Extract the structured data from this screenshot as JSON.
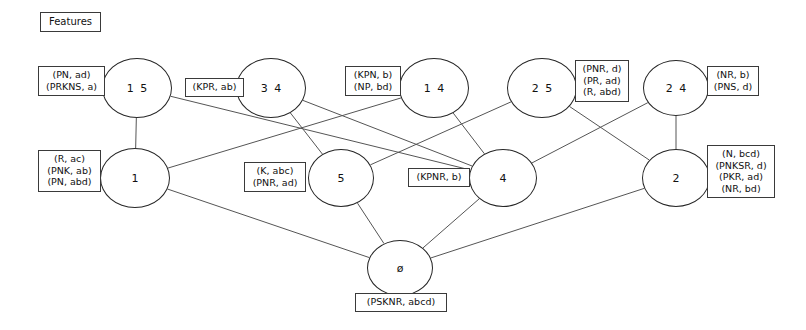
{
  "title_box": {
    "label": "Features"
  },
  "diagram": {
    "kind": "concept-lattice",
    "nodes": [
      {
        "id": "n15",
        "label": "1 5",
        "cx": 137,
        "cy": 88,
        "rx": 35,
        "ry": 30
      },
      {
        "id": "n34",
        "label": "3 4",
        "cx": 271,
        "cy": 88,
        "rx": 35,
        "ry": 30
      },
      {
        "id": "n14",
        "label": "1 4",
        "cx": 434,
        "cy": 88,
        "rx": 35,
        "ry": 30
      },
      {
        "id": "n25",
        "label": "2 5",
        "cx": 542,
        "cy": 88,
        "rx": 35,
        "ry": 30
      },
      {
        "id": "n24",
        "label": "2 4",
        "cx": 676,
        "cy": 88,
        "rx": 33,
        "ry": 28
      },
      {
        "id": "n1",
        "label": "1",
        "cx": 135,
        "cy": 178,
        "rx": 35,
        "ry": 30
      },
      {
        "id": "n5",
        "label": "5",
        "cx": 341,
        "cy": 178,
        "rx": 33,
        "ry": 29
      },
      {
        "id": "n4",
        "label": "4",
        "cx": 503,
        "cy": 178,
        "rx": 34,
        "ry": 29
      },
      {
        "id": "n2",
        "label": "2",
        "cx": 676,
        "cy": 178,
        "rx": 34,
        "ry": 29
      },
      {
        "id": "n0",
        "label": "ø",
        "cx": 400,
        "cy": 268,
        "rx": 33,
        "ry": 28
      }
    ],
    "edges": [
      {
        "from": "n15",
        "to": "n1"
      },
      {
        "from": "n15",
        "to": "n4"
      },
      {
        "from": "n34",
        "to": "n5"
      },
      {
        "from": "n34",
        "to": "n4"
      },
      {
        "from": "n14",
        "to": "n1"
      },
      {
        "from": "n14",
        "to": "n4"
      },
      {
        "from": "n25",
        "to": "n5"
      },
      {
        "from": "n25",
        "to": "n2"
      },
      {
        "from": "n24",
        "to": "n4"
      },
      {
        "from": "n24",
        "to": "n2"
      },
      {
        "from": "n1",
        "to": "n0"
      },
      {
        "from": "n5",
        "to": "n0"
      },
      {
        "from": "n4",
        "to": "n0"
      },
      {
        "from": "n2",
        "to": "n0"
      }
    ],
    "attribute_boxes": [
      {
        "id": "lbl-n15",
        "for": "n15",
        "lines": [
          "(PN, ad)",
          "(PRKNS, a)"
        ],
        "left": 38,
        "top": 66,
        "width": 67
      },
      {
        "id": "lbl-n34",
        "for": "n34",
        "lines": [
          "(KPR, ab)"
        ],
        "left": 185,
        "top": 78,
        "width": 59
      },
      {
        "id": "lbl-n14",
        "for": "n14",
        "lines": [
          "(KPN, b)",
          "(NP, bd)"
        ],
        "left": 345,
        "top": 66,
        "width": 56
      },
      {
        "id": "lbl-n25",
        "for": "n25",
        "lines": [
          "(PNR, d)",
          "(PR, ad)",
          "(R, abd)"
        ],
        "left": 575,
        "top": 60,
        "width": 54
      },
      {
        "id": "lbl-n24",
        "for": "n24",
        "lines": [
          "(NR, b)",
          "(PNS, d)"
        ],
        "left": 707,
        "top": 66,
        "width": 52
      },
      {
        "id": "lbl-n1",
        "for": "n1",
        "lines": [
          "(R, ac)",
          "(PNK, ab)",
          "(PN, abd)"
        ],
        "left": 38,
        "top": 150,
        "width": 63
      },
      {
        "id": "lbl-n5",
        "for": "n5",
        "lines": [
          "(K, abc)",
          "(PNR, ad)"
        ],
        "left": 244,
        "top": 162,
        "width": 62
      },
      {
        "id": "lbl-n4",
        "for": "n4",
        "lines": [
          "(KPNR, b)"
        ],
        "left": 408,
        "top": 168,
        "width": 62
      },
      {
        "id": "lbl-n2",
        "for": "n2",
        "lines": [
          "(N, bcd)",
          "(PNKSR, d)",
          "(PKR, ad)",
          "(NR, bd)"
        ],
        "left": 707,
        "top": 145,
        "width": 68
      },
      {
        "id": "lbl-n0",
        "for": "n0",
        "lines": [
          "(PSKNR, abcd)"
        ],
        "left": 355,
        "top": 293,
        "width": 92
      }
    ],
    "colors": {
      "node_stroke": "#262626",
      "edge_stroke": "#555555",
      "box_stroke": "#3a3a3a",
      "text": "#111111",
      "background": "#ffffff"
    }
  }
}
